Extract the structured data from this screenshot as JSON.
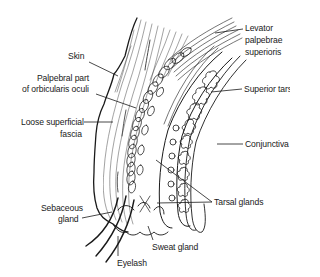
{
  "diagram": {
    "labels": {
      "skin": "Skin",
      "orbicularis_1": "Palpebral part",
      "orbicularis_2": "of orbicularis oculi",
      "fascia_1": "Loose superficial",
      "fascia_2": "fascia",
      "levator_1": "Levator",
      "levator_2": "palpebrae",
      "levator_3": "superioris",
      "tarsus": "Superior tarsus",
      "conjunctiva": "Conjunctiva",
      "tarsal_glands": "Tarsal glands",
      "sebaceous_1": "Sebaceous",
      "sebaceous_2": "gland",
      "sweat_gland": "Sweat gland",
      "eyelash": "Eyelash"
    },
    "colors": {
      "ink": "#1a1a1a",
      "background": "#ffffff"
    }
  }
}
